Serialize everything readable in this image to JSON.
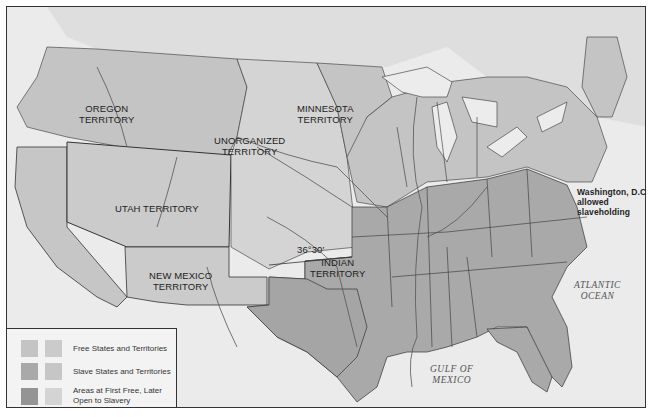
{
  "map": {
    "title": "Free and Slave States and Territories, 1854 (Kansas-Nebraska context)",
    "colors": {
      "background_sea": "#ebebeb",
      "free": "#c4c4c4",
      "free_alt": "#cbcbcb",
      "slave": "#a9a9a9",
      "slave_alt": "#c6c6c6",
      "first_free_later_slave": "#949494",
      "first_free_alt": "#d4d4d4",
      "foreign": "#dedede",
      "border": "#333333"
    },
    "labels": {
      "oregon": "OREGON\nTERRITORY",
      "oregon_l1": "OREGON",
      "oregon_l2": "TERRITORY",
      "minnesota_l1": "MINNESOTA",
      "minnesota_l2": "TERRITORY",
      "unorganized_l1": "UNORGANIZED",
      "unorganized_l2": "TERRITORY",
      "utah": "UTAH TERRITORY",
      "newmexico_l1": "NEW MEXICO",
      "newmexico_l2": "TERRITORY",
      "indian_l1": "INDIAN",
      "indian_l2": "TERRITORY",
      "parallel": "36°30′",
      "dc_l1": "Washington, D.C.,",
      "dc_l2": "allowed",
      "dc_l3": "slaveholding",
      "atlantic_l1": "ATLANTIC",
      "atlantic_l2": "OCEAN",
      "gulf_l1": "GULF OF",
      "gulf_l2": "MEXICO"
    }
  },
  "legend": {
    "items": [
      {
        "label": "Free States and Territories",
        "swatch_a": "#c4c4c4",
        "swatch_b": "#cbcbcb"
      },
      {
        "label": "Slave States and Territories",
        "swatch_a": "#a9a9a9",
        "swatch_b": "#c6c6c6"
      },
      {
        "label": "Areas at First Free, Later Open to Slavery",
        "swatch_a": "#949494",
        "swatch_b": "#d4d4d4"
      }
    ]
  }
}
